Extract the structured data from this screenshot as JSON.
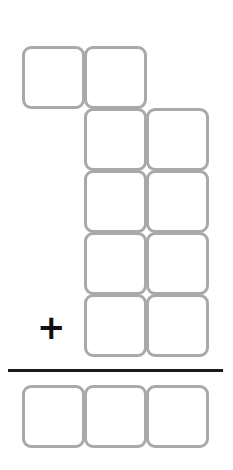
{
  "puzzle": {
    "type": "vertical-addition",
    "operator": "+",
    "addend_rows": [
      {
        "columns": [
          "ones-2",
          "tens"
        ],
        "boxes": 2
      },
      {
        "columns": [
          "tens",
          "ones"
        ],
        "boxes": 2
      },
      {
        "columns": [
          "tens",
          "ones"
        ],
        "boxes": 2
      },
      {
        "columns": [
          "tens",
          "ones"
        ],
        "boxes": 2
      },
      {
        "columns": [
          "tens",
          "ones"
        ],
        "boxes": 2
      }
    ],
    "answer_boxes": 3,
    "colors": {
      "box_border": "#a9a9a9",
      "rule": "#1a1a1a",
      "operator": "#111111"
    }
  }
}
